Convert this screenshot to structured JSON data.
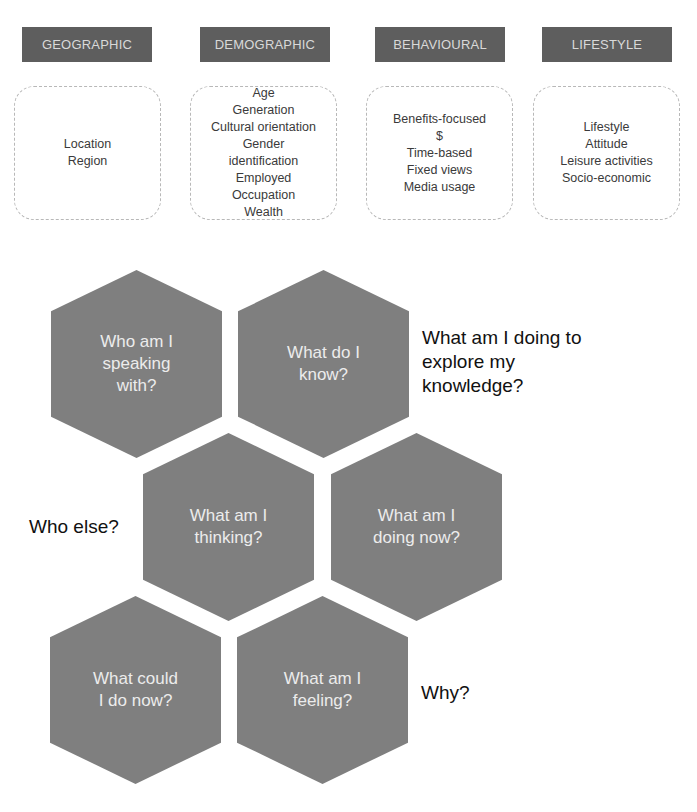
{
  "segments": [
    {
      "header": "GEOGRAPHIC",
      "items": [
        "Location",
        "Region"
      ]
    },
    {
      "header": "DEMOGRAPHIC",
      "items": [
        "Age",
        "Generation",
        "Cultural orientation",
        "Gender",
        "identification",
        "Employed",
        "Occupation",
        "Wealth"
      ]
    },
    {
      "header": "BEHAVIOURAL",
      "items": [
        "Benefits-focused",
        "$",
        "Time-based",
        "Fixed views",
        "Media usage"
      ]
    },
    {
      "header": "LIFESTYLE",
      "items": [
        "Lifestyle",
        "Attitude",
        "Leisure activities",
        "Socio-economic"
      ]
    }
  ],
  "hexagons": [
    {
      "lines": [
        "Who am I",
        "speaking",
        "with?"
      ]
    },
    {
      "lines": [
        "What do I",
        "know?"
      ]
    },
    {
      "lines": [
        "What am I",
        "thinking?"
      ]
    },
    {
      "lines": [
        "What am I",
        "doing now?"
      ]
    },
    {
      "lines": [
        "What could",
        "I do now?"
      ]
    },
    {
      "lines": [
        "What am I",
        "feeling?"
      ]
    }
  ],
  "side_labels": {
    "explore": [
      "What am I doing to",
      "explore my",
      "knowledge?"
    ],
    "who_else": "Who else?",
    "why": "Why?"
  },
  "colors": {
    "header_fill": "#5e5e5e",
    "hex_fill": "#7f7f7f",
    "hex_text": "#ececec",
    "box_border": "#b8b8b8"
  }
}
